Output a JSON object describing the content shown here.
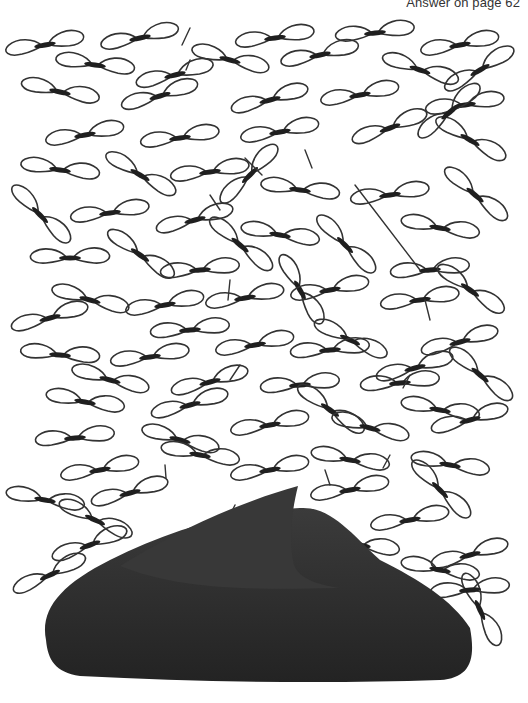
{
  "header": {
    "answer_note": "Answer on page 62"
  },
  "colors": {
    "background": "#ffffff",
    "outline": "#333333",
    "body": "#1f1f1f",
    "fin": "#3a3a3a",
    "fin_dark": "#262626"
  },
  "illustration": {
    "subject": "hidden-object puzzle",
    "description": "Field of scattered winged insect / seed shapes with a dark shark fin rising from the bottom",
    "fin": {
      "body_path": "M46 640 C40 610 60 585 110 560 C170 530 230 512 300 508 C330 506 350 532 380 560 C420 580 452 600 470 628 C476 660 470 678 440 680 C320 684 200 682 80 676 C55 672 48 660 46 640 Z",
      "fin_path": "M120 566 C170 535 230 505 298 486 C292 510 288 540 294 565 C300 580 320 585 340 588 C250 590 180 590 120 566 Z"
    },
    "wings": [
      {
        "x": 45,
        "y": 45,
        "r": -10,
        "s": 1.0
      },
      {
        "x": 140,
        "y": 38,
        "r": -12,
        "s": 1.0
      },
      {
        "x": 230,
        "y": 60,
        "r": 15,
        "s": 1.0
      },
      {
        "x": 275,
        "y": 38,
        "r": -8,
        "s": 1.0
      },
      {
        "x": 375,
        "y": 33,
        "r": -6,
        "s": 1.0
      },
      {
        "x": 460,
        "y": 45,
        "r": -10,
        "s": 1.0
      },
      {
        "x": 95,
        "y": 65,
        "r": 8,
        "s": 1.0
      },
      {
        "x": 175,
        "y": 75,
        "r": -14,
        "s": 1.0
      },
      {
        "x": 320,
        "y": 55,
        "r": -12,
        "s": 1.0
      },
      {
        "x": 420,
        "y": 70,
        "r": 18,
        "s": 1.0
      },
      {
        "x": 480,
        "y": 70,
        "r": -30,
        "s": 1.0
      },
      {
        "x": 60,
        "y": 92,
        "r": 12,
        "s": 1.0
      },
      {
        "x": 160,
        "y": 96,
        "r": -16,
        "s": 1.0
      },
      {
        "x": 270,
        "y": 100,
        "r": -15,
        "s": 1.0
      },
      {
        "x": 360,
        "y": 95,
        "r": -10,
        "s": 1.0
      },
      {
        "x": 465,
        "y": 105,
        "r": -8,
        "s": 1.0
      },
      {
        "x": 85,
        "y": 135,
        "r": -10,
        "s": 1.0
      },
      {
        "x": 180,
        "y": 138,
        "r": -8,
        "s": 1.0
      },
      {
        "x": 280,
        "y": 132,
        "r": -10,
        "s": 1.0
      },
      {
        "x": 390,
        "y": 128,
        "r": -20,
        "s": 1.0
      },
      {
        "x": 470,
        "y": 140,
        "r": 30,
        "s": 1.0
      },
      {
        "x": 450,
        "y": 112,
        "r": -40,
        "s": 1.0
      },
      {
        "x": 60,
        "y": 170,
        "r": 8,
        "s": 1.0
      },
      {
        "x": 140,
        "y": 175,
        "r": 30,
        "s": 1.0
      },
      {
        "x": 210,
        "y": 172,
        "r": -8,
        "s": 1.0
      },
      {
        "x": 250,
        "y": 175,
        "r": -45,
        "s": 1.0
      },
      {
        "x": 300,
        "y": 190,
        "r": 8,
        "s": 1.0
      },
      {
        "x": 390,
        "y": 195,
        "r": -8,
        "s": 1.0
      },
      {
        "x": 475,
        "y": 195,
        "r": 40,
        "s": 1.0
      },
      {
        "x": 40,
        "y": 215,
        "r": 45,
        "s": 1.0
      },
      {
        "x": 110,
        "y": 213,
        "r": -8,
        "s": 1.0
      },
      {
        "x": 195,
        "y": 220,
        "r": -15,
        "s": 1.0
      },
      {
        "x": 280,
        "y": 235,
        "r": 10,
        "s": 1.0
      },
      {
        "x": 345,
        "y": 245,
        "r": 45,
        "s": 1.0
      },
      {
        "x": 440,
        "y": 228,
        "r": 10,
        "s": 1.0
      },
      {
        "x": 70,
        "y": 258,
        "r": 0,
        "s": 1.0
      },
      {
        "x": 140,
        "y": 255,
        "r": 35,
        "s": 1.0
      },
      {
        "x": 200,
        "y": 270,
        "r": -5,
        "s": 1.0
      },
      {
        "x": 240,
        "y": 245,
        "r": 40,
        "s": 1.0
      },
      {
        "x": 300,
        "y": 290,
        "r": 60,
        "s": 1.0
      },
      {
        "x": 430,
        "y": 270,
        "r": -5,
        "s": 1.0
      },
      {
        "x": 470,
        "y": 290,
        "r": 35,
        "s": 1.0
      },
      {
        "x": 90,
        "y": 300,
        "r": 15,
        "s": 1.0
      },
      {
        "x": 50,
        "y": 318,
        "r": -15,
        "s": 1.0
      },
      {
        "x": 165,
        "y": 305,
        "r": -10,
        "s": 1.0
      },
      {
        "x": 245,
        "y": 298,
        "r": -10,
        "s": 1.0
      },
      {
        "x": 330,
        "y": 290,
        "r": -10,
        "s": 1.0
      },
      {
        "x": 420,
        "y": 300,
        "r": -8,
        "s": 1.0
      },
      {
        "x": 190,
        "y": 330,
        "r": -5,
        "s": 1.0
      },
      {
        "x": 255,
        "y": 345,
        "r": -10,
        "s": 1.0
      },
      {
        "x": 350,
        "y": 340,
        "r": 25,
        "s": 1.0
      },
      {
        "x": 460,
        "y": 342,
        "r": -15,
        "s": 1.0
      },
      {
        "x": 60,
        "y": 355,
        "r": 5,
        "s": 1.0
      },
      {
        "x": 150,
        "y": 357,
        "r": -8,
        "s": 1.0
      },
      {
        "x": 330,
        "y": 350,
        "r": -5,
        "s": 1.0
      },
      {
        "x": 415,
        "y": 368,
        "r": -15,
        "s": 1.0
      },
      {
        "x": 480,
        "y": 375,
        "r": 40,
        "s": 1.0
      },
      {
        "x": 110,
        "y": 380,
        "r": 15,
        "s": 1.0
      },
      {
        "x": 210,
        "y": 382,
        "r": -15,
        "s": 1.0
      },
      {
        "x": 300,
        "y": 385,
        "r": -5,
        "s": 1.0
      },
      {
        "x": 400,
        "y": 383,
        "r": -5,
        "s": 1.0
      },
      {
        "x": 85,
        "y": 402,
        "r": 10,
        "s": 1.0
      },
      {
        "x": 190,
        "y": 405,
        "r": -15,
        "s": 1.0
      },
      {
        "x": 330,
        "y": 410,
        "r": 35,
        "s": 1.0
      },
      {
        "x": 440,
        "y": 410,
        "r": 10,
        "s": 1.0
      },
      {
        "x": 75,
        "y": 438,
        "r": -5,
        "s": 1.0
      },
      {
        "x": 180,
        "y": 440,
        "r": 15,
        "s": 1.0
      },
      {
        "x": 270,
        "y": 425,
        "r": -10,
        "s": 1.0
      },
      {
        "x": 370,
        "y": 428,
        "r": 15,
        "s": 1.0
      },
      {
        "x": 470,
        "y": 420,
        "r": -15,
        "s": 1.0
      },
      {
        "x": 100,
        "y": 470,
        "r": -10,
        "s": 1.0
      },
      {
        "x": 200,
        "y": 455,
        "r": 10,
        "s": 1.0
      },
      {
        "x": 270,
        "y": 470,
        "r": -10,
        "s": 1.0
      },
      {
        "x": 350,
        "y": 460,
        "r": 10,
        "s": 1.0
      },
      {
        "x": 450,
        "y": 465,
        "r": 10,
        "s": 1.0
      },
      {
        "x": 45,
        "y": 500,
        "r": 10,
        "s": 1.0
      },
      {
        "x": 130,
        "y": 493,
        "r": -15,
        "s": 1.0
      },
      {
        "x": 350,
        "y": 490,
        "r": -10,
        "s": 1.0
      },
      {
        "x": 440,
        "y": 490,
        "r": 45,
        "s": 1.0
      },
      {
        "x": 95,
        "y": 520,
        "r": 25,
        "s": 1.0
      },
      {
        "x": 90,
        "y": 545,
        "r": -20,
        "s": 1.0
      },
      {
        "x": 360,
        "y": 545,
        "r": 10,
        "s": 1.0
      },
      {
        "x": 410,
        "y": 520,
        "r": -10,
        "s": 1.0
      },
      {
        "x": 470,
        "y": 555,
        "r": -15,
        "s": 1.0
      },
      {
        "x": 50,
        "y": 575,
        "r": -25,
        "s": 1.0
      },
      {
        "x": 440,
        "y": 570,
        "r": 10,
        "s": 1.0
      },
      {
        "x": 480,
        "y": 610,
        "r": 65,
        "s": 1.0
      },
      {
        "x": 470,
        "y": 590,
        "r": -5,
        "s": 1.0
      }
    ],
    "strokes": [
      [
        190,
        28,
        182,
        45
      ],
      [
        190,
        60,
        186,
        70
      ],
      [
        245,
        158,
        262,
        175
      ],
      [
        305,
        150,
        312,
        168
      ],
      [
        210,
        195,
        220,
        210
      ],
      [
        355,
        185,
        420,
        270
      ],
      [
        230,
        280,
        228,
        300
      ],
      [
        425,
        300,
        430,
        320
      ],
      [
        240,
        365,
        230,
        380
      ],
      [
        410,
        375,
        403,
        388
      ],
      [
        165,
        465,
        166,
        478
      ],
      [
        325,
        470,
        330,
        485
      ],
      [
        235,
        505,
        230,
        515
      ],
      [
        390,
        455,
        383,
        468
      ],
      [
        330,
        600,
        325,
        620
      ]
    ]
  }
}
